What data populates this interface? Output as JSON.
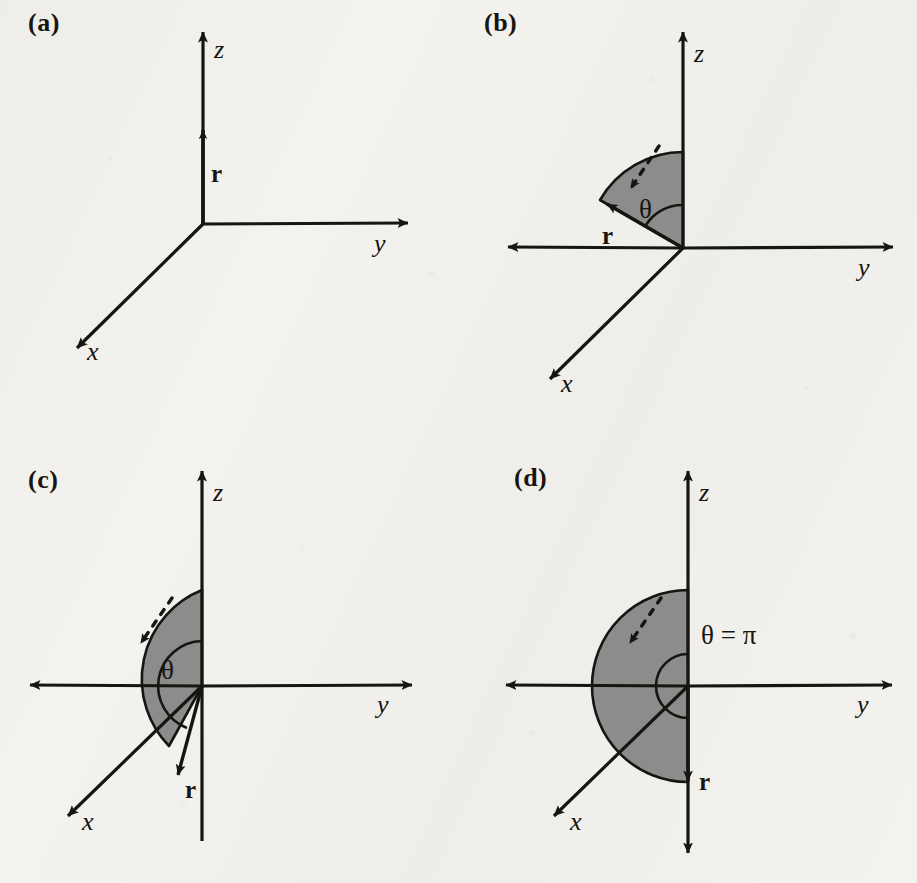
{
  "figure": {
    "background_color": "#f3f2ee",
    "ink_color": "#16150f",
    "wedge_fill_color": "#8c8c8c",
    "wedge_stroke_color": "#16150f"
  },
  "panels": [
    {
      "id": "a",
      "label": "(a)",
      "axes": {
        "z": "z",
        "y": "y",
        "x": "x"
      },
      "vector_label": "r",
      "angle_label": null,
      "angle_value_deg": 0,
      "description_note": null,
      "has_wedge": false,
      "has_dashed_arrow": false,
      "z_axis_negative_visible": false,
      "y_axis_negative_visible": false
    },
    {
      "id": "b",
      "label": "(b)",
      "axes": {
        "z": "z",
        "y": "y",
        "x": "x"
      },
      "vector_label": "r",
      "angle_label": "θ",
      "angle_value_deg": 120,
      "description_note": null,
      "has_wedge": true,
      "has_dashed_arrow": true,
      "z_axis_negative_visible": false,
      "y_axis_negative_visible": true
    },
    {
      "id": "c",
      "label": "(c)",
      "axes": {
        "z": "z",
        "y": "y",
        "x": "x"
      },
      "vector_label": "r",
      "angle_label": "θ",
      "angle_value_deg": 160,
      "description_note": null,
      "has_wedge": true,
      "has_dashed_arrow": true,
      "z_axis_negative_visible": true,
      "y_axis_negative_visible": true
    },
    {
      "id": "d",
      "label": "(d)",
      "axes": {
        "z": "z",
        "y": "y",
        "x": "x"
      },
      "vector_label": "r",
      "angle_label": "θ = π",
      "angle_value_deg": 180,
      "description_note": null,
      "has_wedge": true,
      "has_dashed_arrow": true,
      "z_axis_negative_visible": true,
      "y_axis_negative_visible": true
    }
  ]
}
